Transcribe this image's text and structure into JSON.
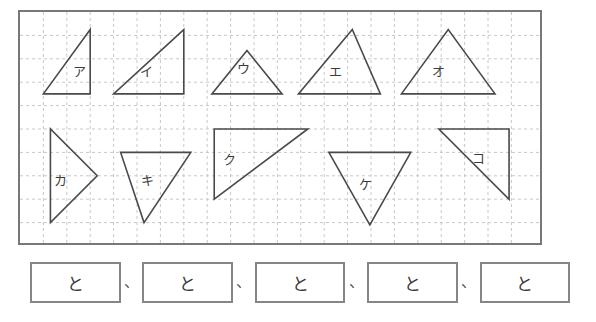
{
  "worksheet": {
    "title": "figure-matching-worksheet",
    "grid": {
      "cell_size": 23.4,
      "cols": 22,
      "rows": 10,
      "line_color": "#c8c8c8",
      "line_style": "dashed",
      "border_color": "#787878",
      "background": "#ffffff"
    },
    "shape_color": "#4a4a4a",
    "label_color": "#3c3c3c",
    "shapes": [
      {
        "label": "ア",
        "name": "triangle-a",
        "label_x": 2.55,
        "label_y": 2.75,
        "points": [
          [
            1.0,
            3.5
          ],
          [
            3.0,
            3.5
          ],
          [
            3.0,
            0.75
          ]
        ],
        "kind": "right-triangle",
        "base_cells": 2,
        "height_cells": 2.75
      },
      {
        "label": "イ",
        "name": "triangle-i",
        "label_x": 5.4,
        "label_y": 2.75,
        "points": [
          [
            4.0,
            3.5
          ],
          [
            7.0,
            3.5
          ],
          [
            7.0,
            0.75
          ]
        ],
        "kind": "right-triangle",
        "base_cells": 3,
        "height_cells": 2.75
      },
      {
        "label": "ウ",
        "name": "triangle-u",
        "label_x": 9.55,
        "label_y": 2.6,
        "points": [
          [
            8.2,
            3.5
          ],
          [
            11.2,
            3.5
          ],
          [
            9.7,
            1.65
          ]
        ],
        "kind": "isosceles-triangle",
        "base_cells": 3,
        "height_cells": 1.85
      },
      {
        "label": "エ",
        "name": "triangle-e",
        "label_x": 13.5,
        "label_y": 2.72,
        "points": [
          [
            11.9,
            3.5
          ],
          [
            15.4,
            3.5
          ],
          [
            14.2,
            0.75
          ]
        ],
        "kind": "scalene-triangle",
        "base_cells": 3.5,
        "height_cells": 2.75
      },
      {
        "label": "オ",
        "name": "triangle-o",
        "label_x": 17.9,
        "label_y": 2.72,
        "points": [
          [
            16.3,
            3.5
          ],
          [
            20.3,
            3.5
          ],
          [
            18.3,
            0.75
          ]
        ],
        "kind": "isosceles-triangle",
        "base_cells": 4,
        "height_cells": 2.75
      },
      {
        "label": "カ",
        "name": "triangle-ka",
        "label_x": 1.75,
        "label_y": 7.4,
        "points": [
          [
            1.3,
            5.0
          ],
          [
            1.3,
            9.0
          ],
          [
            3.3,
            7.0
          ]
        ],
        "kind": "isosceles-triangle",
        "base_cells": 4,
        "height_cells": 2
      },
      {
        "label": "キ",
        "name": "triangle-ki",
        "label_x": 5.45,
        "label_y": 7.4,
        "points": [
          [
            4.3,
            6.0
          ],
          [
            7.3,
            6.0
          ],
          [
            5.3,
            9.0
          ]
        ],
        "kind": "scalene-triangle",
        "base_cells": 3,
        "height_cells": 3
      },
      {
        "label": "ク",
        "name": "triangle-ku",
        "label_x": 8.95,
        "label_y": 6.5,
        "points": [
          [
            8.3,
            5.0
          ],
          [
            12.3,
            5.0
          ],
          [
            8.3,
            8.0
          ]
        ],
        "kind": "right-triangle",
        "base_cells": 4,
        "height_cells": 3
      },
      {
        "label": "ケ",
        "name": "triangle-ke",
        "label_x": 14.75,
        "label_y": 7.55,
        "points": [
          [
            13.2,
            6.0
          ],
          [
            16.7,
            6.0
          ],
          [
            14.95,
            9.1
          ]
        ],
        "kind": "isosceles-triangle",
        "base_cells": 3.5,
        "height_cells": 3.1
      },
      {
        "label": "コ",
        "name": "triangle-ko",
        "label_x": 19.6,
        "label_y": 6.45,
        "points": [
          [
            17.9,
            5.0
          ],
          [
            20.9,
            5.0
          ],
          [
            20.9,
            8.0
          ]
        ],
        "kind": "right-triangle",
        "base_cells": 3,
        "height_cells": 3
      }
    ]
  },
  "answers": {
    "boxes": [
      {
        "name": "answer-box-1",
        "value": "と"
      },
      {
        "name": "answer-box-2",
        "value": "と"
      },
      {
        "name": "answer-box-3",
        "value": "と"
      },
      {
        "name": "answer-box-4",
        "value": "と"
      },
      {
        "name": "answer-box-5",
        "value": "と"
      }
    ],
    "separator": "、"
  }
}
